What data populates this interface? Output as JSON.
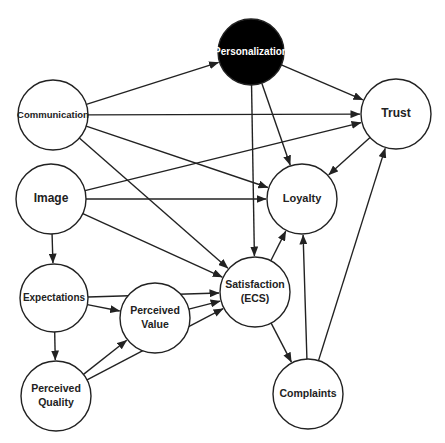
{
  "diagram": {
    "type": "directed-graph",
    "colors": {
      "stroke": "#222222",
      "node_fill": "#ffffff",
      "highlight_fill": "#000000",
      "highlight_text": "#ffffff",
      "text": "#222222"
    },
    "nodes": [
      {
        "id": "personalization",
        "label_lines": [
          "Personalization"
        ],
        "cx": 251,
        "cy": 52,
        "r": 33,
        "highlight": true,
        "font_size": 10
      },
      {
        "id": "communication",
        "label_lines": [
          "Communication"
        ],
        "cx": 53,
        "cy": 115,
        "r": 35,
        "highlight": false,
        "font_size": 9.5
      },
      {
        "id": "trust",
        "label_lines": [
          "Trust"
        ],
        "cx": 396,
        "cy": 114,
        "r": 35,
        "highlight": false,
        "font_size": 12
      },
      {
        "id": "image",
        "label_lines": [
          "Image"
        ],
        "cx": 51,
        "cy": 199,
        "r": 35,
        "highlight": false,
        "font_size": 12
      },
      {
        "id": "loyalty",
        "label_lines": [
          "Loyalty"
        ],
        "cx": 302,
        "cy": 199,
        "r": 35,
        "highlight": false,
        "font_size": 11
      },
      {
        "id": "expectations",
        "label_lines": [
          "Expectations"
        ],
        "cx": 54,
        "cy": 298,
        "r": 34,
        "highlight": false,
        "font_size": 10
      },
      {
        "id": "perceived_value",
        "label_lines": [
          "Perceived",
          "Value"
        ],
        "cx": 155,
        "cy": 318,
        "r": 35,
        "highlight": false,
        "font_size": 10.5
      },
      {
        "id": "satisfaction",
        "label_lines": [
          "Satisfaction",
          "(ECS)"
        ],
        "cx": 255,
        "cy": 292,
        "r": 35,
        "highlight": false,
        "font_size": 10.5
      },
      {
        "id": "perceived_quality",
        "label_lines": [
          "Perceived",
          "Quality"
        ],
        "cx": 56,
        "cy": 396,
        "r": 35,
        "highlight": false,
        "font_size": 10.5
      },
      {
        "id": "complaints",
        "label_lines": [
          "Complaints"
        ],
        "cx": 308,
        "cy": 394,
        "r": 35,
        "highlight": false,
        "font_size": 10.5
      }
    ],
    "edges": [
      {
        "from": "communication",
        "to": "personalization"
      },
      {
        "from": "communication",
        "to": "trust"
      },
      {
        "from": "communication",
        "to": "loyalty"
      },
      {
        "from": "communication",
        "to": "satisfaction"
      },
      {
        "from": "personalization",
        "to": "trust"
      },
      {
        "from": "personalization",
        "to": "loyalty"
      },
      {
        "from": "personalization",
        "to": "satisfaction"
      },
      {
        "from": "image",
        "to": "trust"
      },
      {
        "from": "image",
        "to": "loyalty"
      },
      {
        "from": "image",
        "to": "satisfaction"
      },
      {
        "from": "image",
        "to": "expectations"
      },
      {
        "from": "trust",
        "to": "loyalty"
      },
      {
        "from": "expectations",
        "to": "satisfaction"
      },
      {
        "from": "expectations",
        "to": "perceived_value"
      },
      {
        "from": "expectations",
        "to": "perceived_quality"
      },
      {
        "from": "perceived_value",
        "to": "satisfaction"
      },
      {
        "from": "perceived_quality",
        "to": "perceived_value"
      },
      {
        "from": "perceived_quality",
        "to": "satisfaction"
      },
      {
        "from": "satisfaction",
        "to": "loyalty"
      },
      {
        "from": "satisfaction",
        "to": "complaints"
      },
      {
        "from": "complaints",
        "to": "loyalty"
      },
      {
        "from": "complaints",
        "to": "trust"
      }
    ]
  }
}
